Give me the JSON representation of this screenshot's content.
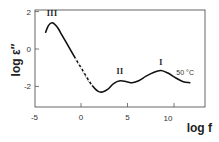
{
  "chart_data": {
    "type": "line",
    "title": "",
    "xlabel": "log f",
    "ylabel": "log ε″",
    "xlim": [
      -5,
      13.2
    ],
    "ylim": [
      -3.1,
      2.1
    ],
    "x_ticks": [
      -5,
      0,
      5,
      10
    ],
    "x_tick_labels": [
      "-5",
      "0",
      "5",
      "10"
    ],
    "y_ticks": [
      -2,
      0,
      2
    ],
    "y_tick_labels": [
      "-2",
      "0",
      "2"
    ],
    "grid": false,
    "legend": null,
    "series": [
      {
        "name": "50 °C",
        "x": [
          -3.8,
          -3.5,
          -3.1,
          -2.6,
          -2.0,
          -1.3,
          -0.6,
          0.0,
          0.6,
          1.2,
          1.8,
          2.3,
          2.9,
          3.5,
          4.2,
          4.9,
          5.5,
          6.2,
          7.0,
          7.8,
          8.6,
          9.4,
          10.2,
          11.0,
          11.7
        ],
        "y": [
          0.9,
          1.25,
          1.4,
          1.2,
          0.7,
          0.1,
          -0.5,
          -1.0,
          -1.5,
          -1.95,
          -2.25,
          -2.3,
          -2.15,
          -1.85,
          -1.7,
          -1.75,
          -1.8,
          -1.7,
          -1.45,
          -1.25,
          -1.15,
          -1.3,
          -1.55,
          -1.75,
          -1.8
        ],
        "dashed_segment_x": [
          -0.6,
          0.9
        ]
      }
    ],
    "annotations": [
      {
        "text": "III",
        "x": -3.1,
        "y": 1.75
      },
      {
        "text": "II",
        "x": 4.2,
        "y": -1.35
      },
      {
        "text": "I",
        "x": 8.6,
        "y": -0.85
      },
      {
        "text": "50 °C",
        "x": 11.2,
        "y": -1.4
      }
    ]
  },
  "labels": {
    "x_axis_title": "log f",
    "y_axis_title": "log ε″",
    "peaks": [
      "III",
      "II",
      "I"
    ],
    "temperature": "50 °C"
  }
}
